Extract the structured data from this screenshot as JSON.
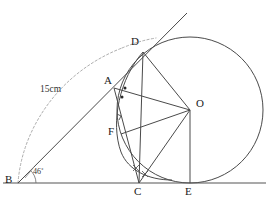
{
  "figure": {
    "type": "geometry-diagram",
    "background_color": "#ffffff",
    "stroke_color": "#3a3a3a",
    "dashed_color": "#9a9a9a",
    "label_color": "#1a1a1a"
  },
  "vertex_labels": {
    "A": "A",
    "B": "B",
    "C": "C",
    "D": "D",
    "E": "E",
    "F": "F",
    "O": "O"
  },
  "measure_labels": {
    "length": "15cm",
    "angle": "46˚"
  },
  "points": {
    "A": {
      "x": 114,
      "y": 88
    },
    "B": {
      "x": 18,
      "y": 183
    },
    "C": {
      "x": 139,
      "y": 183
    },
    "D": {
      "x": 143,
      "y": 52
    },
    "E": {
      "x": 190,
      "y": 183
    },
    "F": {
      "x": 121,
      "y": 134
    },
    "O": {
      "x": 190,
      "y": 110
    }
  },
  "label_positions": {
    "A": {
      "x": 104,
      "y": 80
    },
    "B": {
      "x": 6,
      "y": 176
    },
    "C": {
      "x": 134,
      "y": 186
    },
    "D": {
      "x": 133,
      "y": 39
    },
    "E": {
      "x": 185,
      "y": 186
    },
    "F": {
      "x": 109,
      "y": 128
    },
    "O": {
      "x": 196,
      "y": 99
    },
    "length": {
      "x": 40,
      "y": 89
    },
    "angle": {
      "x": 33,
      "y": 170
    }
  },
  "circle": {
    "cx": 190,
    "cy": 110,
    "r": 73
  },
  "dashed_arc": {
    "description": "arc of radius 15cm centred at B sweeping from baseline up to the tangent ray",
    "center": {
      "x": 18,
      "y": 183
    },
    "radius": 140,
    "start": {
      "x": 18,
      "y": 183
    },
    "end": {
      "x": 151,
      "y": 40
    }
  },
  "segments": [
    {
      "name": "baseline-BE-extended",
      "from": {
        "x": 3,
        "y": 183
      },
      "to": {
        "x": 266,
        "y": 183
      }
    },
    {
      "name": "tangent-ray-B-through-D",
      "from": {
        "x": 18,
        "y": 183
      },
      "to": {
        "x": 187,
        "y": 13
      }
    },
    {
      "name": "chord-D-O",
      "from": {
        "x": 143,
        "y": 52
      },
      "to": {
        "x": 190,
        "y": 110
      }
    },
    {
      "name": "chord-A-O",
      "from": {
        "x": 114,
        "y": 88
      },
      "to": {
        "x": 190,
        "y": 110
      }
    },
    {
      "name": "chord-F-O",
      "from": {
        "x": 121,
        "y": 134
      },
      "to": {
        "x": 190,
        "y": 110
      }
    },
    {
      "name": "chord-C-O",
      "from": {
        "x": 139,
        "y": 183
      },
      "to": {
        "x": 190,
        "y": 110
      }
    },
    {
      "name": "radius-O-E",
      "from": {
        "x": 190,
        "y": 110
      },
      "to": {
        "x": 190,
        "y": 183
      }
    },
    {
      "name": "segment-A-C",
      "from": {
        "x": 114,
        "y": 88
      },
      "to": {
        "x": 139,
        "y": 183
      }
    },
    {
      "name": "segment-D-C",
      "from": {
        "x": 143,
        "y": 52
      },
      "to": {
        "x": 139,
        "y": 183
      }
    }
  ],
  "arcs": [
    {
      "name": "arc-D-through-F-to-C",
      "from": {
        "x": 143,
        "y": 52
      },
      "to": {
        "x": 171,
        "y": 180
      }
    }
  ],
  "angle_marks": {
    "dots_at_A": [
      {
        "x": 124,
        "y": 88
      },
      {
        "x": 122,
        "y": 97
      }
    ],
    "right_angle_at_F_side": {
      "x": 115,
      "y": 118
    },
    "crosses_at_C": [
      {
        "x": 136,
        "y": 168
      },
      {
        "x": 145,
        "y": 174
      }
    ],
    "angle_arc_at_B": {
      "cx": 18,
      "cy": 183,
      "r": 18
    }
  }
}
